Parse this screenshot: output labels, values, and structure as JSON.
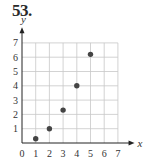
{
  "problem": {
    "number": "53."
  },
  "chart_data": {
    "type": "scatter",
    "title": "",
    "xlabel": "x",
    "ylabel": "y",
    "xlim": [
      0,
      7
    ],
    "ylim": [
      0,
      7
    ],
    "grid": true,
    "legend": null,
    "x_ticks": [
      "0",
      "1",
      "2",
      "3",
      "4",
      "5",
      "6",
      "7"
    ],
    "y_ticks": [
      "1",
      "2",
      "3",
      "4",
      "5",
      "6",
      "7"
    ],
    "points": [
      {
        "x": 1,
        "y": 0.3
      },
      {
        "x": 2,
        "y": 1.0
      },
      {
        "x": 3,
        "y": 2.3
      },
      {
        "x": 4,
        "y": 4.0
      },
      {
        "x": 5,
        "y": 6.2
      }
    ],
    "colors": {
      "points": "#444444",
      "grid": "#c8c8c8",
      "axes": "#222222"
    }
  }
}
